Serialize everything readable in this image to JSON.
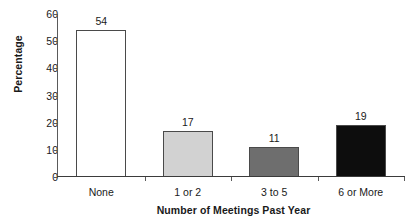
{
  "chart_data": {
    "type": "bar",
    "title": "",
    "categories": [
      "None",
      "1 or 2",
      "3 to 5",
      "6 or More"
    ],
    "values": [
      54,
      17,
      11,
      19
    ],
    "value_labels": [
      "54",
      "17",
      "11",
      "19"
    ],
    "bar_colors": [
      "#ffffff",
      "#d2d2d2",
      "#6e6e6e",
      "#0d0d0d"
    ],
    "bar_border_color": "#4a4a4a",
    "xlabel": "Number of Meetings Past Year",
    "ylabel": "Percentage",
    "ylim": [
      0,
      60
    ],
    "yticks": [
      0,
      10,
      20,
      30,
      40,
      50,
      60
    ],
    "ytick_labels": [
      "0",
      "10",
      "20",
      "30",
      "40",
      "50",
      "60"
    ],
    "grid": false,
    "legend": false,
    "background": "#ffffff",
    "axis_color": "#5a5a5a"
  }
}
